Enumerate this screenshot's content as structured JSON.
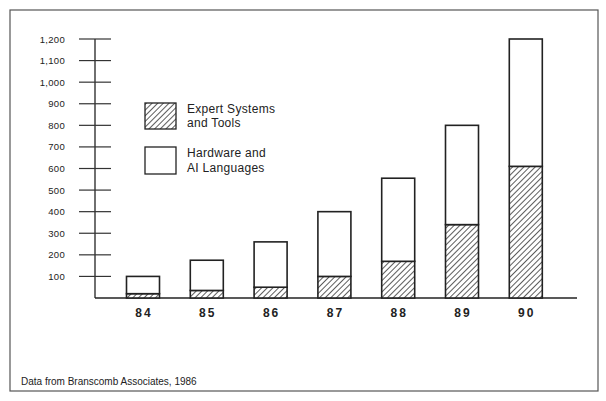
{
  "chart_data": {
    "type": "bar",
    "stacked": true,
    "title": "",
    "xlabel": "",
    "ylabel": "",
    "categories": [
      "84",
      "85",
      "86",
      "87",
      "88",
      "89",
      "90"
    ],
    "series": [
      {
        "name": "Expert Systems and Tools",
        "legend_lines": [
          "Expert Systems",
          "and Tools"
        ],
        "fill": "hatched",
        "values": [
          20,
          35,
          50,
          100,
          170,
          340,
          610
        ]
      },
      {
        "name": "Hardware and AI Languages",
        "legend_lines": [
          "Hardware and",
          "AI Languages"
        ],
        "fill": "white",
        "values": [
          80,
          140,
          210,
          300,
          385,
          460,
          590
        ]
      }
    ],
    "totals": [
      100,
      175,
      260,
      400,
      555,
      800,
      1200
    ],
    "ylim": [
      0,
      1200
    ],
    "yticks": [
      100,
      200,
      300,
      400,
      500,
      600,
      700,
      800,
      900,
      1000,
      1100,
      1200
    ],
    "ytick_labels": [
      "100",
      "200",
      "300",
      "400",
      "500",
      "600",
      "700",
      "800",
      "900",
      "1,000",
      "1,100",
      "1,200"
    ],
    "grid": false,
    "legend_position": "upper-left-inside",
    "annotation": "Data from Branscomb Associates, 1986"
  }
}
